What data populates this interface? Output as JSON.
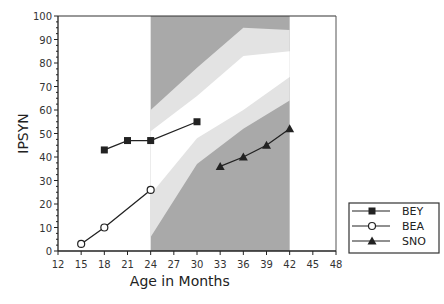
{
  "chart_data": {
    "type": "line",
    "title": "",
    "xlabel": "Age in Months",
    "ylabel": "IPSYN",
    "xlim": [
      12,
      48
    ],
    "ylim": [
      0,
      100
    ],
    "x_ticks": [
      12,
      15,
      18,
      21,
      24,
      27,
      30,
      33,
      36,
      39,
      42,
      45,
      48
    ],
    "y_ticks": [
      0,
      10,
      20,
      30,
      40,
      50,
      60,
      70,
      80,
      90,
      100
    ],
    "grid": false,
    "legend_position": "lower right, outside plot",
    "series": [
      {
        "name": "BEY",
        "marker": "filled-square",
        "x": [
          18,
          21,
          24,
          30
        ],
        "y": [
          43,
          47,
          47,
          55
        ]
      },
      {
        "name": "BEA",
        "marker": "open-circle",
        "x": [
          15,
          18,
          24
        ],
        "y": [
          3,
          10,
          26
        ]
      },
      {
        "name": "SNO",
        "marker": "filled-triangle",
        "x": [
          33,
          36,
          39,
          42
        ],
        "y": [
          36,
          40,
          45,
          52
        ]
      }
    ],
    "shaded_regions": {
      "x_range": [
        24,
        42
      ],
      "upper_dark_lower_edge": {
        "x": [
          24,
          30,
          36,
          42
        ],
        "y": [
          60,
          78,
          95,
          94
        ]
      },
      "upper_light_lower_edge": {
        "x": [
          24,
          30,
          36,
          42
        ],
        "y": [
          51,
          66,
          83,
          85
        ]
      },
      "lower_light_upper_edge": {
        "x": [
          24,
          30,
          36,
          42
        ],
        "y": [
          24,
          48,
          60,
          74
        ]
      },
      "lower_dark_upper_edge": {
        "x": [
          24,
          30,
          36,
          42
        ],
        "y": [
          6,
          37,
          52,
          64
        ]
      }
    }
  },
  "legend": {
    "items": [
      {
        "label": "BEY"
      },
      {
        "label": "BEA"
      },
      {
        "label": "SNO"
      }
    ]
  },
  "axes": {
    "xlabel": "Age in Months",
    "ylabel": "IPSYN"
  },
  "colors": {
    "dark_shade": "#a9a9a9",
    "light_shade": "#e3e3e3",
    "line": "#222222"
  }
}
